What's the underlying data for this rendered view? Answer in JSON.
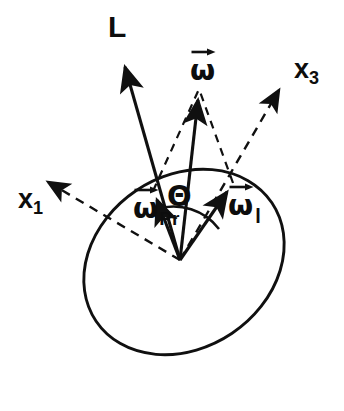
{
  "figure": {
    "background_color": "#ffffff",
    "ink_color": "#101010",
    "width": 344,
    "height": 411
  },
  "labels": {
    "angular_momentum": "L",
    "omega_total": "ω",
    "omega_precession_symbol": "ω",
    "omega_precession_subscript": "Pr",
    "omega_body_symbol": "ω",
    "omega_body_subscript": "l",
    "axis_x1_symbol": "x",
    "axis_x1_subscript": "1",
    "axis_x3_symbol": "x",
    "axis_x3_subscript": "3",
    "angle_theta": "Θ"
  },
  "geometry": {
    "origin": [
      180,
      260
    ],
    "body_ellipse": {
      "center": [
        184,
        262
      ],
      "semi_major": 106,
      "semi_minor": 86,
      "rotation_deg": -34
    },
    "vectors": [
      {
        "name": "angular-momentum-L",
        "from": [
          180,
          260
        ],
        "to": [
          122,
          56
        ],
        "style": "solid",
        "label": "L"
      },
      {
        "name": "omega-total",
        "from": [
          180,
          260
        ],
        "to": [
          199,
          89
        ],
        "style": "solid",
        "label": "ω"
      },
      {
        "name": "omega-precession",
        "from": [
          180,
          260
        ],
        "to": [
          153,
          191
        ],
        "style": "solid",
        "label": "ωPr"
      },
      {
        "name": "omega-body",
        "from": [
          180,
          260
        ],
        "to": [
          233,
          183
        ],
        "style": "solid",
        "label": "ωl"
      },
      {
        "name": "axis-x1",
        "from": [
          180,
          260
        ],
        "to": [
          42,
          178
        ],
        "style": "dashed",
        "label": "x1"
      },
      {
        "name": "axis-x3",
        "from": [
          180,
          260
        ],
        "to": [
          284,
          82
        ],
        "style": "dashed",
        "label": "x3"
      }
    ],
    "construction_lines": [
      {
        "name": "parallelogram-edge-precession-to-omega",
        "from": [
          153,
          191
        ],
        "to": [
          199,
          89
        ]
      },
      {
        "name": "parallelogram-edge-body-to-omega",
        "from": [
          233,
          183
        ],
        "to": [
          199,
          89
        ]
      }
    ],
    "angle_arc": {
      "name": "theta-arc",
      "center": [
        180,
        260
      ],
      "radius": 56,
      "from_vector": "omega-precession",
      "to_vector": "omega-body"
    }
  },
  "label_positions": {
    "L": [
      108,
      14
    ],
    "omega_total": [
      190,
      55
    ],
    "omega_precession": [
      133,
      193
    ],
    "omega_body": [
      228,
      190
    ],
    "x1": [
      18,
      186
    ],
    "x3": [
      296,
      55
    ],
    "theta": [
      167,
      181
    ]
  }
}
